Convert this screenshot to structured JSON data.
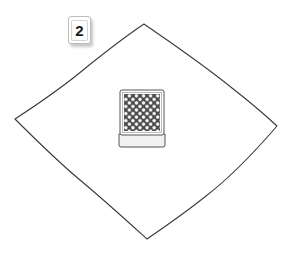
{
  "step": {
    "number": "2"
  },
  "mat": {
    "shape": "diamond",
    "stroke_color": "#3a3a3a",
    "corners": {
      "top": [
        144,
        24
      ],
      "right": [
        277,
        126
      ],
      "bottom": [
        147,
        239
      ],
      "left": [
        15,
        119
      ]
    }
  },
  "card_deck": {
    "orientation": "face-down",
    "back_pattern": "diamond-lattice",
    "colors": {
      "pattern_dark": "#4a4a4a",
      "pattern_light": "#ffffff",
      "edge": "#555555",
      "side_fill": "#f2f2f2"
    }
  }
}
